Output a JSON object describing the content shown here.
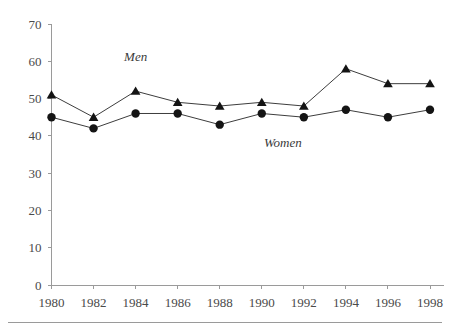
{
  "chart_data": {
    "type": "line",
    "title": "",
    "subtitle": "",
    "xlabel": "",
    "ylabel": "",
    "x": [
      1980,
      1982,
      1984,
      1986,
      1988,
      1990,
      1992,
      1994,
      1996,
      1998
    ],
    "xtick_labels": [
      "1980",
      "1982",
      "1984",
      "1986",
      "1988",
      "1990",
      "1992",
      "1994",
      "1996",
      "1998"
    ],
    "ytick_labels": [
      "0",
      "10",
      "20",
      "30",
      "40",
      "50",
      "60",
      "70"
    ],
    "yticks": [
      0,
      10,
      20,
      30,
      40,
      50,
      60,
      70
    ],
    "ylim": [
      0,
      70
    ],
    "xlim": [
      1980,
      1998
    ],
    "grid": false,
    "legend_position": "inline-annotation",
    "series": [
      {
        "name": "Men",
        "marker": "triangle",
        "color": "#141414",
        "values": [
          51,
          45,
          52,
          49,
          48,
          49,
          48,
          58,
          54,
          54
        ],
        "label_x": 1984,
        "label_y": 60
      },
      {
        "name": "Women",
        "marker": "circle",
        "color": "#141414",
        "values": [
          45,
          42,
          46,
          46,
          43,
          46,
          45,
          47,
          45,
          47
        ],
        "label_x": 1991,
        "label_y": 37
      }
    ],
    "annotations": [
      {
        "text": "Men",
        "x": 1984,
        "y": 60
      },
      {
        "text": "Women",
        "x": 1991,
        "y": 37
      }
    ]
  }
}
